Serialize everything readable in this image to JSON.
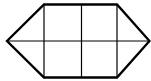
{
  "diagram": {
    "type": "hexagon-grid",
    "colors": {
      "stroke": "#000000",
      "background": "#ffffff"
    },
    "outline_points": "7,41 44,4.5 117,4.5 149.5,41 117,77.5 44,77.5",
    "vertical_lines": [
      {
        "x": 44,
        "y1": 4.5,
        "y2": 77.5
      },
      {
        "x": 81.5,
        "y1": 4.5,
        "y2": 77.5
      },
      {
        "x": 117,
        "y1": 4.5,
        "y2": 77.5
      }
    ],
    "horizontal_lines": [
      {
        "y": 41,
        "x1": 7,
        "x2": 149.5
      }
    ]
  }
}
